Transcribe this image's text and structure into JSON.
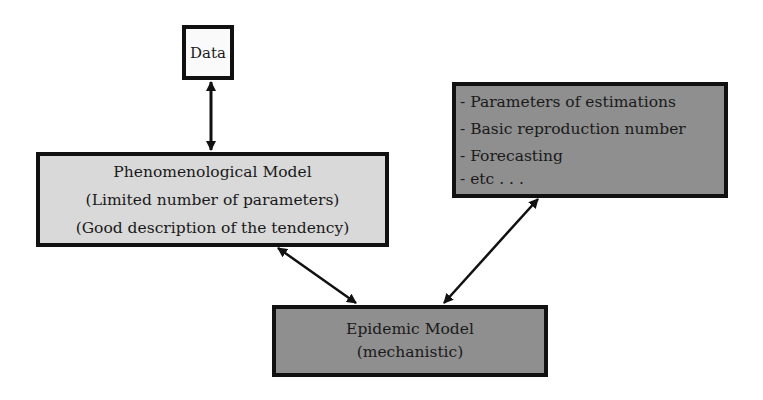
{
  "diagram": {
    "nodes": {
      "data": {
        "label": "Data"
      },
      "phenomenological": {
        "title": "Phenomenological Model",
        "lines": [
          "(Limited number of parameters)",
          "(Good description of the tendency)"
        ]
      },
      "outputs": {
        "items": [
          "- Parameters of estimations",
          "- Basic reproduction number",
          "- Forecasting",
          "- etc . . ."
        ]
      },
      "epidemic": {
        "title": "Epidemic Model",
        "subtitle": "(mechanistic)"
      }
    },
    "edges": [
      {
        "from": "data",
        "to": "phenomenological",
        "type": "bidirectional"
      },
      {
        "from": "phenomenological",
        "to": "epidemic",
        "type": "bidirectional"
      },
      {
        "from": "epidemic",
        "to": "outputs",
        "type": "bidirectional"
      }
    ],
    "colors": {
      "data_fill": "#fafafa",
      "phenomenological_fill": "#d9d9d9",
      "outputs_fill": "#8f8f8f",
      "epidemic_fill": "#8f8f8f",
      "border": "#111111"
    }
  }
}
